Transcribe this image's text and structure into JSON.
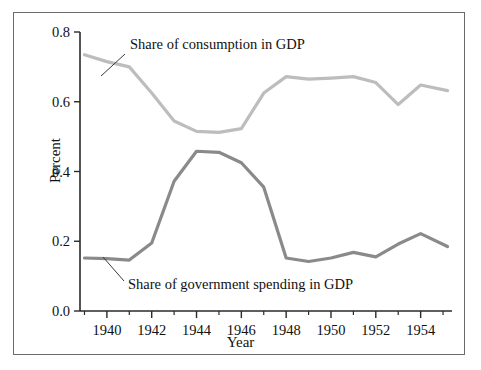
{
  "figure": {
    "background": "#ffffff",
    "border_color": "#6a6a6a"
  },
  "chart_data": {
    "type": "line",
    "title": "",
    "xlabel": "Year",
    "ylabel": "Percent",
    "xlim": [
      1938.8,
      1955.4
    ],
    "ylim": [
      0.0,
      0.8
    ],
    "grid": false,
    "legend_position": "inline-annotations",
    "xticks": [
      1940,
      1942,
      1944,
      1946,
      1948,
      1950,
      1952,
      1954
    ],
    "xticklabels": [
      "1940",
      "1942",
      "1944",
      "1946",
      "1948",
      "1950",
      "1952",
      "1954"
    ],
    "xminorticks": [
      1939,
      1941,
      1943,
      1945,
      1947,
      1949,
      1951,
      1953,
      1955
    ],
    "yticks": [
      0.0,
      0.2,
      0.4,
      0.6,
      0.8
    ],
    "yticklabels": [
      "0.0",
      "0.2",
      "0.4",
      "0.6",
      "0.8"
    ],
    "x": [
      1939,
      1940,
      1941,
      1942,
      1943,
      1944,
      1945,
      1946,
      1947,
      1948,
      1949,
      1950,
      1951,
      1952,
      1953,
      1954,
      1955.2
    ],
    "series": [
      {
        "name": "Share of consumption in GDP",
        "color": "#bdbdbd",
        "linewidth": 3.2,
        "values": [
          0.735,
          0.715,
          0.7,
          0.625,
          0.545,
          0.515,
          0.512,
          0.523,
          0.625,
          0.672,
          0.665,
          0.668,
          0.672,
          0.655,
          0.592,
          0.648,
          0.632
        ]
      },
      {
        "name": "Share of government spending in GDP",
        "color": "#8a8a8a",
        "linewidth": 3.2,
        "values": [
          0.152,
          0.15,
          0.146,
          0.195,
          0.372,
          0.458,
          0.455,
          0.425,
          0.355,
          0.152,
          0.142,
          0.152,
          0.168,
          0.155,
          0.192,
          0.222,
          0.185
        ]
      }
    ],
    "annotations": [
      {
        "text": "Share of consumption in GDP",
        "text_x": 130,
        "text_y": 49,
        "leader_from_x": 125,
        "leader_from_y": 54,
        "leader_to_x": 101,
        "leader_to_y": 76
      },
      {
        "text": "Share of government spending in GDP",
        "text_x": 128,
        "text_y": 289,
        "leader_from_x": 124,
        "leader_from_y": 281,
        "leader_to_x": 103,
        "leader_to_y": 257
      }
    ]
  }
}
